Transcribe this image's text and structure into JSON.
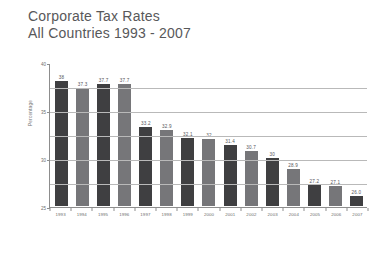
{
  "title": {
    "line1": "Corporate Tax Rates",
    "line2": "All Countries 1993 - 2007"
  },
  "chart_data": {
    "type": "bar",
    "title": "Corporate Tax Rates All Countries 1993 - 2007",
    "xlabel": "",
    "ylabel": "Percentage",
    "ylim": [
      25,
      40
    ],
    "yticks": [
      25,
      30,
      35,
      40
    ],
    "ytick_labels": [
      "25",
      "30",
      "35",
      "40"
    ],
    "gridlines": [
      27.5,
      30,
      32.5,
      35,
      37.5
    ],
    "grid": true,
    "legend": "none",
    "categories": [
      "1993",
      "1994",
      "1995",
      "1996",
      "1997",
      "1998",
      "1999",
      "2000",
      "2001",
      "2002",
      "2003",
      "2004",
      "2005",
      "2006",
      "2007"
    ],
    "values": [
      38,
      37.3,
      37.7,
      37.7,
      33.2,
      32.9,
      32.1,
      32,
      31.4,
      30.7,
      30,
      28.9,
      27.2,
      27.1,
      26.0
    ],
    "value_labels": [
      "38",
      "37.3",
      "37.7",
      "37.7",
      "33.2",
      "32.9",
      "32.1",
      "32",
      "31.4",
      "30.7",
      "30",
      "28.9",
      "27.2",
      "27.1",
      "26.0"
    ],
    "bar_colors": [
      "#3f3f41",
      "#767679",
      "#3f3f41",
      "#767679",
      "#3f3f41",
      "#767679",
      "#3f3f41",
      "#767679",
      "#3f3f41",
      "#767679",
      "#3f3f41",
      "#767679",
      "#3f3f41",
      "#767679",
      "#3f3f41"
    ],
    "axis_color": "#8d8d8d",
    "grid_color": "#b9b9b9",
    "text_color": "#6d6d6d",
    "background": "#ffffff"
  }
}
